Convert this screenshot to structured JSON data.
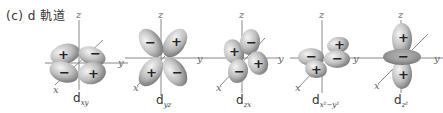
{
  "title": "(c)  d 軌道",
  "axis_labels": {
    "x": "x",
    "y": "y",
    "z": "z"
  },
  "orbitals": [
    {
      "name": "dxy",
      "base": "d",
      "sub": "xy",
      "signs": [
        "+",
        "−",
        "−",
        "+"
      ]
    },
    {
      "name": "dyz",
      "base": "d",
      "sub": "yz",
      "signs": [
        "−",
        "+",
        "+",
        "−"
      ]
    },
    {
      "name": "dzx",
      "base": "d",
      "sub": "zx",
      "signs": [
        "+",
        "−",
        "−",
        "+"
      ]
    },
    {
      "name": "dx2-y2",
      "base": "d",
      "sub": "x²−y²",
      "signs": [
        "+",
        "−",
        "−",
        "+"
      ]
    },
    {
      "name": "dz2",
      "base": "d",
      "sub": "z²",
      "signs": [
        "+",
        "−",
        "+"
      ]
    }
  ],
  "colors": {
    "lobe_light": "#e8e8e8",
    "lobe_dark": "#8a8a8a",
    "axis": "#888888"
  }
}
